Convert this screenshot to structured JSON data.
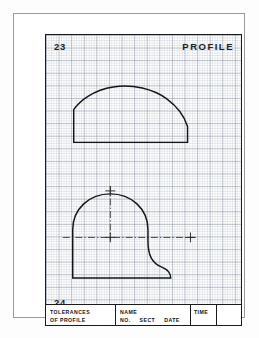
{
  "sheet": {
    "top_number": "23",
    "bottom_number": "24",
    "title": "PROFILE"
  },
  "title_block": {
    "tolerances": {
      "line1": "TOLERANCES",
      "line2": "OF PROFILE"
    },
    "name_section": {
      "line1": "NAME",
      "no": "NO.",
      "sect": "SECT",
      "date": "DATE"
    },
    "time": {
      "label": "TIME"
    }
  },
  "colors": {
    "outline": "#141414",
    "centerline": "#2a2a2a",
    "grid_minor": "#96a0b2",
    "grid_major": "#788296",
    "frame": "#1a1a1a",
    "paper": "#ffffff"
  },
  "drawings": {
    "upper_profile": {
      "name": "dome-profile-elevation",
      "description": "Flat-based arched profile with broad crown arc and steep right flank",
      "path": "M 28 108 L 28 75 C 34 66 48 55 68 52 C 88 49 108 54 122 64 C 133 72 140 82 143 92 L 143 108 Z"
    },
    "lower_profile": {
      "name": "dome-profile-plan",
      "description": "Semicircular dome with vertical left side, flat bottom and S-curve fillet at right",
      "path": "M 27 245 L 27 196 C 27 175 44 160 65 160 C 86 160 103 175 103 196 L 103 207 C 103 222 107 230 117 234 C 122 236 126 239 126 245 L 126 245 Z"
    },
    "centerlines": {
      "vertical": {
        "x": 65,
        "y1": 152,
        "y2": 207
      },
      "horizontal": {
        "y": 204,
        "x1": 17,
        "x2": 151
      }
    },
    "tickmarks": [
      {
        "name": "crown-center-mark",
        "cx": 65,
        "cy": 157,
        "size": 5
      },
      {
        "name": "origin-center-mark",
        "cx": 65,
        "cy": 204,
        "size": 5
      },
      {
        "name": "radius-reference-mark",
        "cx": 146,
        "cy": 204,
        "size": 5
      }
    ]
  }
}
